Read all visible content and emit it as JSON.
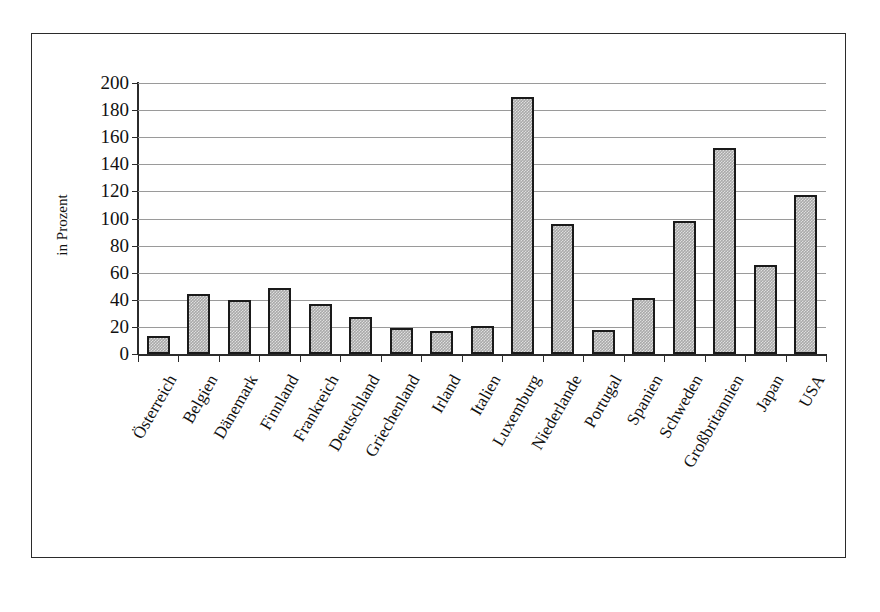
{
  "figure": {
    "caption_faint": ""
  },
  "chart_data": {
    "type": "bar",
    "title": "",
    "xlabel": "",
    "ylabel": "in Prozent",
    "ylim": [
      0,
      200
    ],
    "ytick_step": 20,
    "yticks": [
      200,
      180,
      160,
      140,
      120,
      100,
      80,
      60,
      40,
      20,
      0
    ],
    "grid": true,
    "legend": "none",
    "bar_color": "#a9a9a9",
    "bar_border_color": "#1a1a1a",
    "categories": [
      "Österreich",
      "Belgien",
      "Dänemark",
      "Finnland",
      "Frankreich",
      "Deutschland",
      "Griechenland",
      "Irland",
      "Italien",
      "Luxemburg",
      "Niederlande",
      "Portugal",
      "Spanien",
      "Schweden",
      "Großbritannien",
      "Japan",
      "USA"
    ],
    "values": [
      13,
      44,
      40,
      49,
      37,
      27,
      19,
      17,
      21,
      190,
      96,
      18,
      41,
      98,
      152,
      66,
      117
    ]
  }
}
